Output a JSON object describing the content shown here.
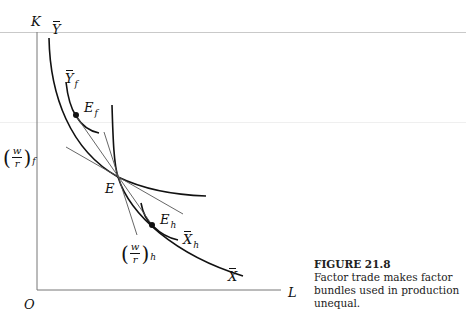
{
  "figure": {
    "number_label": "FIGURE 21.8",
    "caption": "Factor trade makes factor bundles used in production unequal."
  },
  "axes": {
    "vertical_label": "K",
    "horizontal_label": "L",
    "origin_label": "O"
  },
  "curves": {
    "Y_bar": {
      "base": "Y",
      "subscript": "",
      "has_bar": true
    },
    "Y_bar_f": {
      "base": "Y",
      "subscript": "f",
      "has_bar": true
    },
    "X_bar": {
      "base": "X",
      "subscript": "",
      "has_bar": true
    },
    "X_bar_h": {
      "base": "X",
      "subscript": "h",
      "has_bar": true
    }
  },
  "points": {
    "E": {
      "label": "E"
    },
    "E_f": {
      "base": "E",
      "subscript": "f"
    },
    "E_h": {
      "base": "E",
      "subscript": "h"
    }
  },
  "price_ratios": {
    "foreign": {
      "numerator": "w",
      "denominator": "r",
      "subscript": "f",
      "open": "(",
      "close": ")"
    },
    "home": {
      "numerator": "w",
      "denominator": "r",
      "subscript": "h",
      "open": "(",
      "close": ")"
    }
  },
  "colors": {
    "ink": "#111111",
    "thin_line": "#555555",
    "axis": "#777777",
    "rule": "#c9c9c9"
  }
}
